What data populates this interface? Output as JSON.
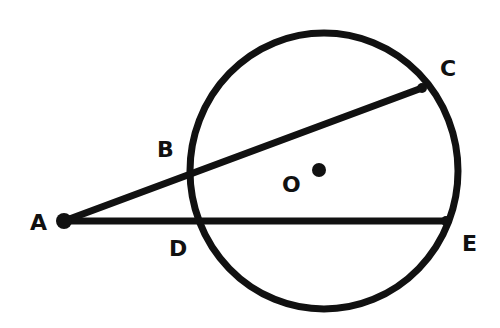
{
  "diagram": {
    "type": "geometry",
    "colors": {
      "stroke": "#111111",
      "background": "#ffffff"
    },
    "circle": {
      "center_label": "O",
      "cx": 324,
      "cy": 171,
      "rx": 134,
      "ry": 138
    },
    "points": [
      {
        "id": "A",
        "label": "A",
        "x": 64,
        "y": 221,
        "label_x": 30,
        "label_y": 230
      },
      {
        "id": "B",
        "label": "B",
        "x": 190,
        "y": 177,
        "label_x": 157,
        "label_y": 157
      },
      {
        "id": "C",
        "label": "C",
        "x": 422,
        "y": 88,
        "label_x": 440,
        "label_y": 76
      },
      {
        "id": "D",
        "label": "D",
        "x": 200,
        "y": 221,
        "label_x": 169,
        "label_y": 256
      },
      {
        "id": "E",
        "label": "E",
        "x": 446,
        "y": 221,
        "label_x": 462,
        "label_y": 251
      },
      {
        "id": "O",
        "label": "O",
        "x": 319,
        "y": 170,
        "label_x": 282,
        "label_y": 192
      }
    ],
    "segments": [
      {
        "from": "A",
        "to": "C",
        "name": "secant-ABC"
      },
      {
        "from": "A",
        "to": "E",
        "name": "secant-ADE"
      }
    ]
  }
}
